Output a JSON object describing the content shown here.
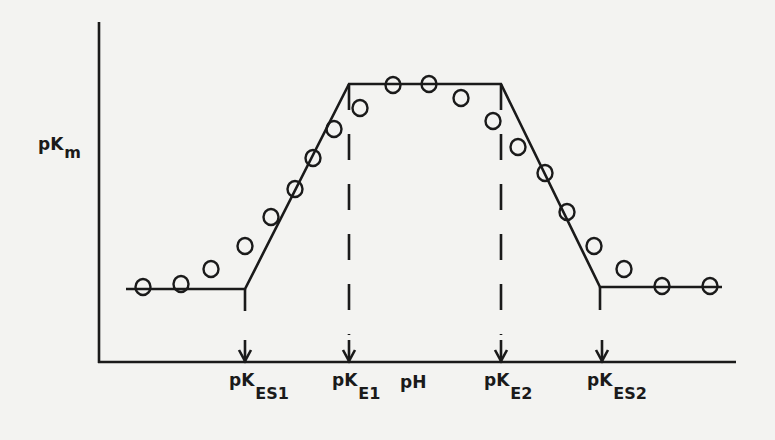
{
  "diagram": {
    "title": "",
    "y_axis_label": {
      "main": "pK",
      "sub": "m"
    },
    "x_axis_label": "pH",
    "markers": [
      {
        "main": "pK",
        "sub": "ES1"
      },
      {
        "main": "pK",
        "sub": "E1"
      },
      {
        "main": "pK",
        "sub": "E2"
      },
      {
        "main": "pK",
        "sub": "ES2"
      }
    ],
    "line_color": "#1a1a1a",
    "background": "#f3f3f1"
  },
  "chart_data": {
    "type": "scatter",
    "title": "",
    "xlabel": "pH",
    "ylabel": "pKm",
    "x_markers": [
      "pK_ES1",
      "pK_E1",
      "pK_E2",
      "pK_ES2"
    ],
    "asymptotes": [
      {
        "segment": "low plateau",
        "from": [
          126,
          289
        ],
        "to": [
          245,
          289
        ]
      },
      {
        "segment": "rising slope",
        "from": [
          245,
          289
        ],
        "to": [
          349,
          84
        ]
      },
      {
        "segment": "top plateau",
        "from": [
          349,
          84
        ],
        "to": [
          501,
          84
        ]
      },
      {
        "segment": "falling slope",
        "from": [
          501,
          84
        ],
        "to": [
          600,
          287
        ]
      },
      {
        "segment": "high plateau",
        "from": [
          600,
          287
        ],
        "to": [
          722,
          287
        ]
      }
    ],
    "points_px": [
      [
        143,
        287
      ],
      [
        181,
        284
      ],
      [
        211,
        269
      ],
      [
        245,
        246
      ],
      [
        271,
        217
      ],
      [
        295,
        189
      ],
      [
        313,
        158
      ],
      [
        334,
        129
      ],
      [
        360,
        108
      ],
      [
        393,
        85
      ],
      [
        429,
        84
      ],
      [
        461,
        98
      ],
      [
        493,
        121
      ],
      [
        518,
        147
      ],
      [
        545,
        173
      ],
      [
        567,
        212
      ],
      [
        594,
        246
      ],
      [
        624,
        269
      ],
      [
        662,
        286
      ],
      [
        710,
        286
      ]
    ],
    "grid": false,
    "legend": null
  }
}
